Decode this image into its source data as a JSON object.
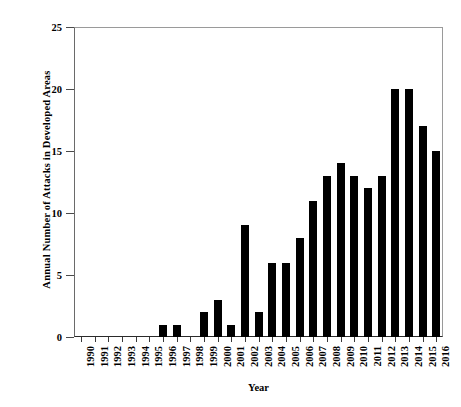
{
  "chart_data": {
    "type": "bar",
    "title": "",
    "xlabel": "Year",
    "ylabel": "Annual Number of Attacks in Developed Areas",
    "categories": [
      "1990",
      "1991",
      "1992",
      "1993",
      "1994",
      "1995",
      "1996",
      "1997",
      "1998",
      "1999",
      "2000",
      "2001",
      "2002",
      "2003",
      "2004",
      "2005",
      "2006",
      "2007",
      "2008",
      "2009",
      "2010",
      "2011",
      "2012",
      "2013",
      "2014",
      "2015",
      "2016"
    ],
    "values": [
      0,
      0,
      0,
      0,
      0,
      0,
      1,
      1,
      0,
      2,
      3,
      1,
      9,
      2,
      6,
      6,
      8,
      11,
      13,
      14,
      13,
      12,
      13,
      20,
      20,
      17,
      15
    ],
    "ylim": [
      0,
      25
    ],
    "yticks": [
      0,
      5,
      10,
      15,
      20,
      25
    ],
    "ytick_labels": [
      "0",
      "5",
      "10",
      "15",
      "20",
      "25"
    ],
    "grid": false,
    "legend": null,
    "bar_color": "#000000",
    "axis_color": "#000000",
    "frame_color": "#9a9a9a",
    "background": "#ffffff"
  },
  "axes": {
    "y_title": "Annual Number of Attacks in Developed Areas",
    "x_title": "Year"
  }
}
